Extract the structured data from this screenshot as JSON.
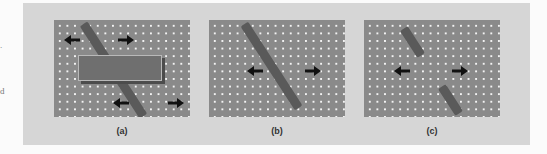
{
  "margin_fragments": [
    ".",
    "d"
  ],
  "figure": {
    "panels": [
      {
        "id": "a",
        "caption": "(a)",
        "description": "Oblique bar moving horizontally, partially occluded by a rectangle; arrows at both visible ends"
      },
      {
        "id": "b",
        "caption": "(b)",
        "description": "Single oblique bar moving horizontally; arrows on both sides"
      },
      {
        "id": "c",
        "caption": "(c)",
        "description": "Two separate oblique bar segments; arrows between them"
      }
    ],
    "colors": {
      "band": "#d6d6d6",
      "panel_bg": "#8a8a8a",
      "dots": "#f4f4f4",
      "bar": "#5a5a5a",
      "occluder": "#6f6f6f",
      "arrow": "#111111"
    },
    "arrow_icons": {
      "left": "arrow-left-icon",
      "right": "arrow-right-icon"
    }
  }
}
